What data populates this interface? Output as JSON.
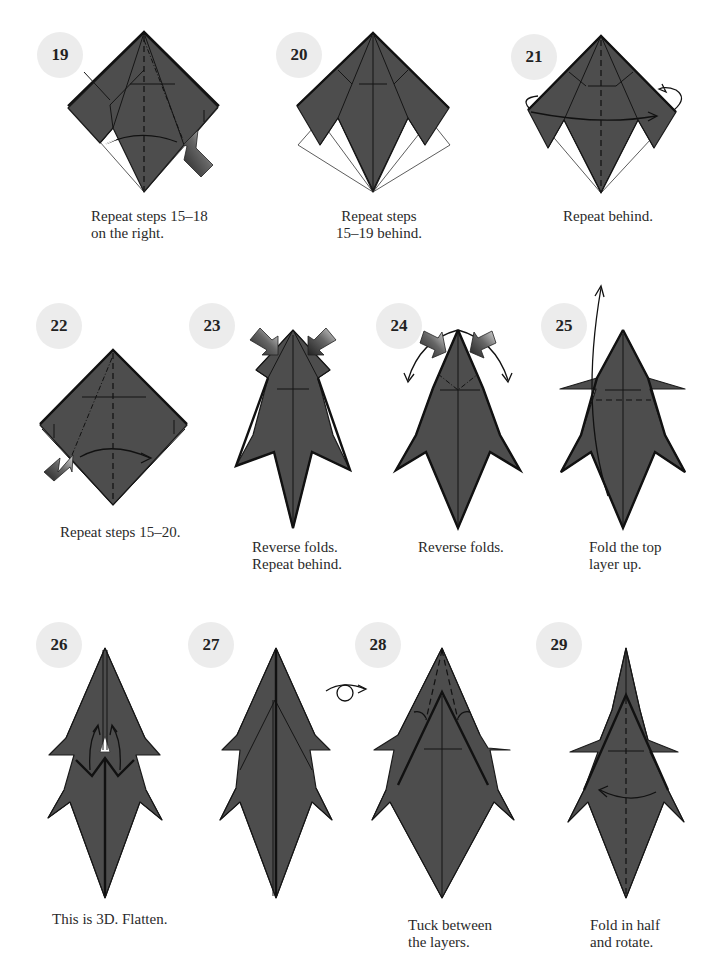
{
  "page": {
    "colors": {
      "paper": "#4d4d4d",
      "badge": "#ececec",
      "background": "#ffffff",
      "line": "#151515"
    },
    "steps": [
      {
        "number": "19",
        "caption": [
          "Repeat steps 15–18",
          "on the right."
        ],
        "figure": "square-base-with-pushed-flap-right-icon"
      },
      {
        "number": "20",
        "caption": [
          "Repeat steps",
          "15–19 behind."
        ],
        "figure": "square-base-kite-icon"
      },
      {
        "number": "21",
        "caption": [
          "Repeat behind."
        ],
        "figure": "square-base-turn-over-icon"
      },
      {
        "number": "22",
        "caption": [
          "Repeat steps 15–20."
        ],
        "figure": "square-base-pushed-flap-left-icon"
      },
      {
        "number": "23",
        "caption": [
          "Reverse folds.",
          "Repeat behind."
        ],
        "figure": "body-reverse-fold-top-icon"
      },
      {
        "number": "24",
        "caption": [
          "Reverse folds."
        ],
        "figure": "body-reverse-fold-points-icon"
      },
      {
        "number": "25",
        "caption": [
          "Fold the top",
          "layer up."
        ],
        "figure": "body-fold-layer-up-icon"
      },
      {
        "number": "26",
        "caption": [
          "This is 3D. Flatten."
        ],
        "figure": "body-3d-flatten-icon"
      },
      {
        "number": "27",
        "caption": [],
        "figure": "body-flattened-icon"
      },
      {
        "number": "28",
        "caption": [
          "Tuck between",
          "the layers."
        ],
        "figure": "body-tuck-layers-icon",
        "turn_over_symbol": "turn-over-icon"
      },
      {
        "number": "29",
        "caption": [
          "Fold in half",
          "and rotate."
        ],
        "figure": "body-fold-half-icon"
      }
    ]
  }
}
